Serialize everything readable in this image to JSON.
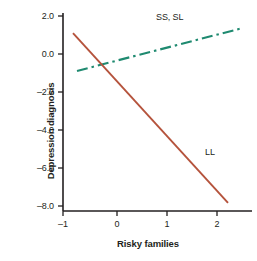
{
  "chart_data": {
    "type": "line",
    "title": "",
    "xlabel": "Risky families",
    "ylabel": "Depression diagnosis",
    "xlim": [
      -1.3,
      2.7
    ],
    "ylim": [
      -8.6,
      2.4
    ],
    "xticks": [
      -1,
      0,
      1,
      2
    ],
    "xticklabels": [
      "–1",
      "0",
      "1",
      "2"
    ],
    "yticks": [
      2.0,
      0.0,
      -2.0,
      -4.0,
      -6.0,
      -8.0
    ],
    "yticklabels": [
      "2.0",
      "0.0",
      "–2.0",
      "–4.0",
      "–6.0",
      "–8.0"
    ],
    "grid": false,
    "legend": "inline-annotations",
    "series": [
      {
        "name": "SS, SL",
        "label": "SS, SL",
        "color": "#1f8a70",
        "linestyle": "dash-dot",
        "x": [
          -0.8,
          2.52
        ],
        "y": [
          -0.89,
          1.37
        ],
        "slope": 0.68,
        "label_position": {
          "x": 1.22,
          "y": 1.9
        }
      },
      {
        "name": "LL",
        "label": "LL",
        "color": "#b5533c",
        "linestyle": "solid",
        "x": [
          -0.88,
          2.22
        ],
        "y": [
          1.1,
          -7.84
        ],
        "slope": -2.88,
        "label_position": {
          "x": 1.76,
          "y": -5.2
        }
      }
    ]
  },
  "axes": {
    "x_title": "Risky families",
    "y_title": "Depression diagnosis",
    "axis_color": "#231f20"
  },
  "colors": {
    "background": "#ffffff",
    "ss_sl_line": "#1f8a70",
    "ll_line": "#b5533c",
    "text": "#231f20"
  }
}
